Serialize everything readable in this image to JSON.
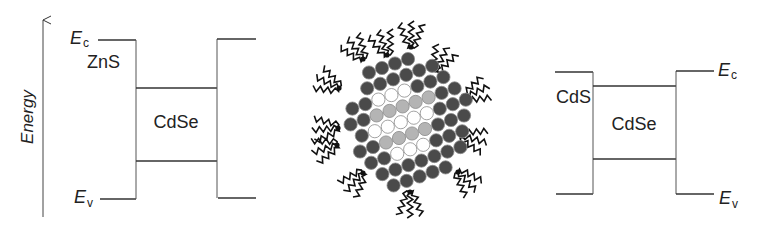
{
  "figure": {
    "axis": {
      "label": "Energy",
      "arrow_x": 43,
      "arrow_top_y": 20,
      "arrow_bottom_y": 217
    },
    "left_panel": {
      "name": "ZnS/CdSe band alignment",
      "shell_label": "ZnS",
      "core_label": "CdSe",
      "ec_label": {
        "main": "E",
        "sub": "c"
      },
      "ev_label": {
        "main": "E",
        "sub": "v"
      },
      "shell_left": {
        "x1": 98,
        "x2": 136,
        "ec_y": 40,
        "ev_y": 199
      },
      "core": {
        "x1": 136,
        "x2": 217,
        "top_y": 88,
        "bottom_y": 161
      },
      "shell_right": {
        "x1": 217,
        "x2": 256,
        "ec_y": 39,
        "ev_y": 198
      }
    },
    "nanoparticle": {
      "name": "core-shell nanocrystal with ligands",
      "colors": {
        "shell": "#4a4a4a",
        "core_light": "#ffffff",
        "core_gray": "#b4b4b4",
        "outline": "#8a8a8a",
        "ligand": "#111111"
      },
      "lattice": {
        "origin": [
          408,
          59
        ],
        "row_step": [
          -13,
          4.5
        ],
        "col_step": [
          11.2,
          11.3
        ],
        "radius": 6.6
      },
      "ligand_anchors": [
        [
          387,
          55
        ],
        [
          411,
          47
        ],
        [
          436,
          70
        ],
        [
          465,
          97
        ],
        [
          462,
          136
        ],
        [
          458,
          172
        ],
        [
          410,
          192
        ],
        [
          363,
          173
        ],
        [
          337,
          145
        ],
        [
          338,
          128
        ],
        [
          339,
          88
        ],
        [
          363,
          59
        ]
      ]
    },
    "right_panel": {
      "name": "CdS/CdSe band alignment",
      "shell_label": "CdS",
      "core_label": "CdSe",
      "ec_label": {
        "main": "E",
        "sub": "c"
      },
      "ev_label": {
        "main": "E",
        "sub": "v"
      },
      "shell_left": {
        "x1": 555,
        "x2": 593,
        "ec_y": 72,
        "ev_y": 194
      },
      "core": {
        "x1": 593,
        "x2": 676,
        "top_y": 86,
        "bottom_y": 159
      },
      "shell_right": {
        "x1": 676,
        "x2": 714,
        "ec_y": 71,
        "ev_y": 194
      }
    }
  }
}
